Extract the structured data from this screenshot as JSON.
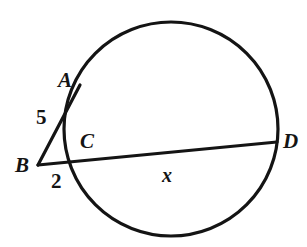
{
  "figure": {
    "type": "circle-secants-geometry-diagram",
    "background_color": "#ffffff",
    "stroke_color": "#141414"
  },
  "labels": {
    "point_a": "A",
    "point_b": "B",
    "point_c": "C",
    "point_d": "D",
    "segment_ba": "5",
    "segment_bc": "2",
    "segment_cd": "x"
  },
  "geometry": {
    "circle": {
      "cx": 171,
      "cy": 129,
      "r": 107
    },
    "external_point_b": {
      "x": 38,
      "y": 165
    },
    "point_a": {
      "x": 80,
      "y": 85
    },
    "point_c": {
      "x": 78,
      "y": 156
    },
    "point_d": {
      "x": 277,
      "y": 142
    },
    "secant_ba_path": "M 38 165 L 80 85",
    "secant_bd_path": "M 38 165 L 277 142"
  }
}
